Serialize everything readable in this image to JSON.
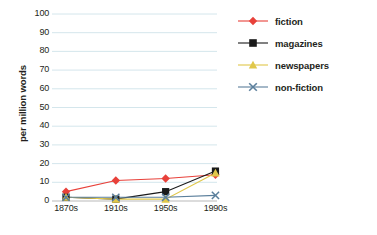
{
  "chart_data": {
    "type": "line",
    "title": "",
    "xlabel": "",
    "ylabel": "per million words",
    "categories": [
      "1870s",
      "1910s",
      "1950s",
      "1990s"
    ],
    "ylim": [
      0,
      100
    ],
    "ytick_values": [
      0,
      10,
      20,
      30,
      40,
      50,
      60,
      70,
      80,
      90,
      100
    ],
    "ytick_labels": [
      "0",
      "10",
      "20",
      "30",
      "40",
      "50",
      "60",
      "70",
      "80",
      "90",
      "100"
    ],
    "grid": true,
    "grid_color": "#cfe3ea",
    "legend_position": "right",
    "series": [
      {
        "name": "fiction",
        "color": "#e8413a",
        "marker": "diamond",
        "values": [
          5,
          11,
          12,
          14
        ]
      },
      {
        "name": "magazines",
        "color": "#1a1a1a",
        "marker": "square",
        "values": [
          2,
          1,
          5,
          16
        ]
      },
      {
        "name": "newspapers",
        "color": "#e0c74a",
        "marker": "triangle",
        "values": [
          2,
          1,
          1,
          15
        ]
      },
      {
        "name": "non-fiction",
        "color": "#5b7f9c",
        "marker": "cross",
        "values": [
          2,
          2,
          2,
          3
        ]
      }
    ]
  },
  "legend": {
    "items": [
      {
        "label": "fiction"
      },
      {
        "label": "magazines"
      },
      {
        "label": "newspapers"
      },
      {
        "label": "non-fiction"
      }
    ]
  }
}
